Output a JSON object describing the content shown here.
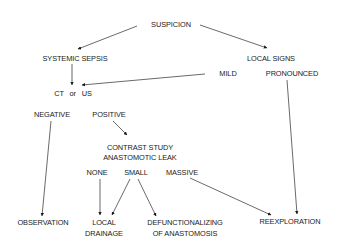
{
  "diagram": {
    "type": "flowchart",
    "nodes": {
      "suspicion": "SUSPICION",
      "systemic_sepsis": "SYSTEMIC SEPSIS",
      "local_signs": "LOCAL SIGNS",
      "mild": "MILD",
      "pronounced": "PRONOUNCED",
      "ct_or_us": "CT   or   US",
      "negative": "NEGATIVE",
      "positive": "POSITIVE",
      "contrast_study": {
        "line1": "CONTRAST STUDY",
        "line2": "ANASTOMOTIC LEAK"
      },
      "none": "NONE",
      "small": "SMALL",
      "massive": "MASSIVE",
      "observation": "OBSERVATION",
      "local_drainage": {
        "line1": "LOCAL",
        "line2": "DRAINAGE"
      },
      "defunctionalizing": {
        "line1": "DEFUNCTIONALIZING",
        "line2": "OF ANASTOMOSIS"
      },
      "reexploration": "REEXPLORATION"
    },
    "edges": [
      {
        "from": "suspicion",
        "to": "systemic_sepsis"
      },
      {
        "from": "suspicion",
        "to": "local_signs"
      },
      {
        "from": "systemic_sepsis",
        "to": "ct_or_us"
      },
      {
        "from": "mild",
        "to": "ct_or_us"
      },
      {
        "from": "pronounced",
        "to": "reexploration"
      },
      {
        "from": "negative",
        "to": "observation"
      },
      {
        "from": "positive",
        "to": "contrast_study"
      },
      {
        "from": "none",
        "to": "local_drainage"
      },
      {
        "from": "small",
        "to": "local_drainage"
      },
      {
        "from": "small",
        "to": "defunctionalizing"
      },
      {
        "from": "massive",
        "to": "reexploration"
      }
    ],
    "colors": {
      "line": "#2a2a2a",
      "text": "#1a1a1a",
      "background": "#ffffff"
    }
  }
}
